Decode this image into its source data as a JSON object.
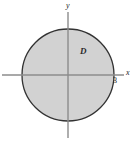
{
  "figure": {
    "kind": "cartesian-plane-diagram",
    "background_color": "#ffffff",
    "width": 138,
    "height": 141
  },
  "axes": {
    "x_axis": {
      "label": "x",
      "color": "#8c8c8c",
      "y_pixel": 75,
      "x_start_pixel": 2,
      "x_end_pixel": 124
    },
    "y_axis": {
      "label": "y",
      "color": "#8c8c8c",
      "x_pixel": 68,
      "y_start_pixel": 12,
      "y_end_pixel": 138
    },
    "origin": {
      "x_pixel": 68,
      "y_pixel": 75
    }
  },
  "ticks": [
    {
      "label": "3",
      "axis": "x",
      "value": 3,
      "x_pixel": 114,
      "y_pixel": 75
    }
  ],
  "shapes": [
    {
      "type": "circle",
      "name": "region-D-disk",
      "center_x_pixel": 68,
      "center_y_pixel": 75,
      "radius_pixel": 46,
      "radius_value": 3,
      "fill_color": "#d2d2d2",
      "stroke_color": "#333333",
      "stroke_width": 1.3
    }
  ],
  "annotations": [
    {
      "name": "region-label-D",
      "text": "D",
      "x_pixel": 80,
      "y_pixel": 47,
      "color": "#2b2b2b"
    }
  ],
  "colors": {
    "fill": "#d2d2d2",
    "outline": "#333333",
    "axis": "#8c8c8c",
    "text": "#1a1a1a",
    "background": "#ffffff"
  }
}
